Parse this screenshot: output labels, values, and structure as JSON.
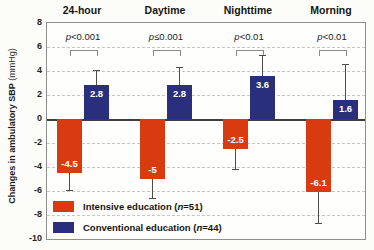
{
  "figure": {
    "ylabel_main": "Changes in ambulatory SBP",
    "ylabel_unit": " (mmHg)"
  },
  "chart_data": {
    "type": "bar",
    "title": "",
    "categories": [
      "24-hour",
      "Daytime",
      "Nighttime",
      "Morning"
    ],
    "p_values": [
      "p<0.001",
      "p≤0.001",
      "p<0.01",
      "p<0.01"
    ],
    "ylabel": "Changes in ambulatory SBP (mmHg)",
    "ylim": [
      -10,
      8
    ],
    "yticks": [
      8,
      6,
      4,
      2,
      0,
      -2,
      -4,
      -6,
      -8,
      -10
    ],
    "grid": "dashed-horizontal",
    "legend_position": "bottom-left-inside",
    "series": [
      {
        "name": "Intensive education",
        "n_label": "n=51",
        "color": "#d73b0f",
        "values": [
          -4.5,
          -5,
          -2.5,
          -6.1
        ],
        "labels": [
          "-4.5",
          "-5",
          "-2.5",
          "-6.1"
        ],
        "whisker_ends": [
          -5.9,
          -6.6,
          -4.2,
          -8.7
        ]
      },
      {
        "name": "Conventional education",
        "n_label": "n=44",
        "color": "#2a2f7d",
        "values": [
          2.8,
          2.8,
          3.6,
          1.6
        ],
        "labels": [
          "2.8",
          "2.8",
          "3.6",
          "1.6"
        ],
        "whisker_ends": [
          4.1,
          4.3,
          5.3,
          4.6
        ]
      }
    ]
  }
}
